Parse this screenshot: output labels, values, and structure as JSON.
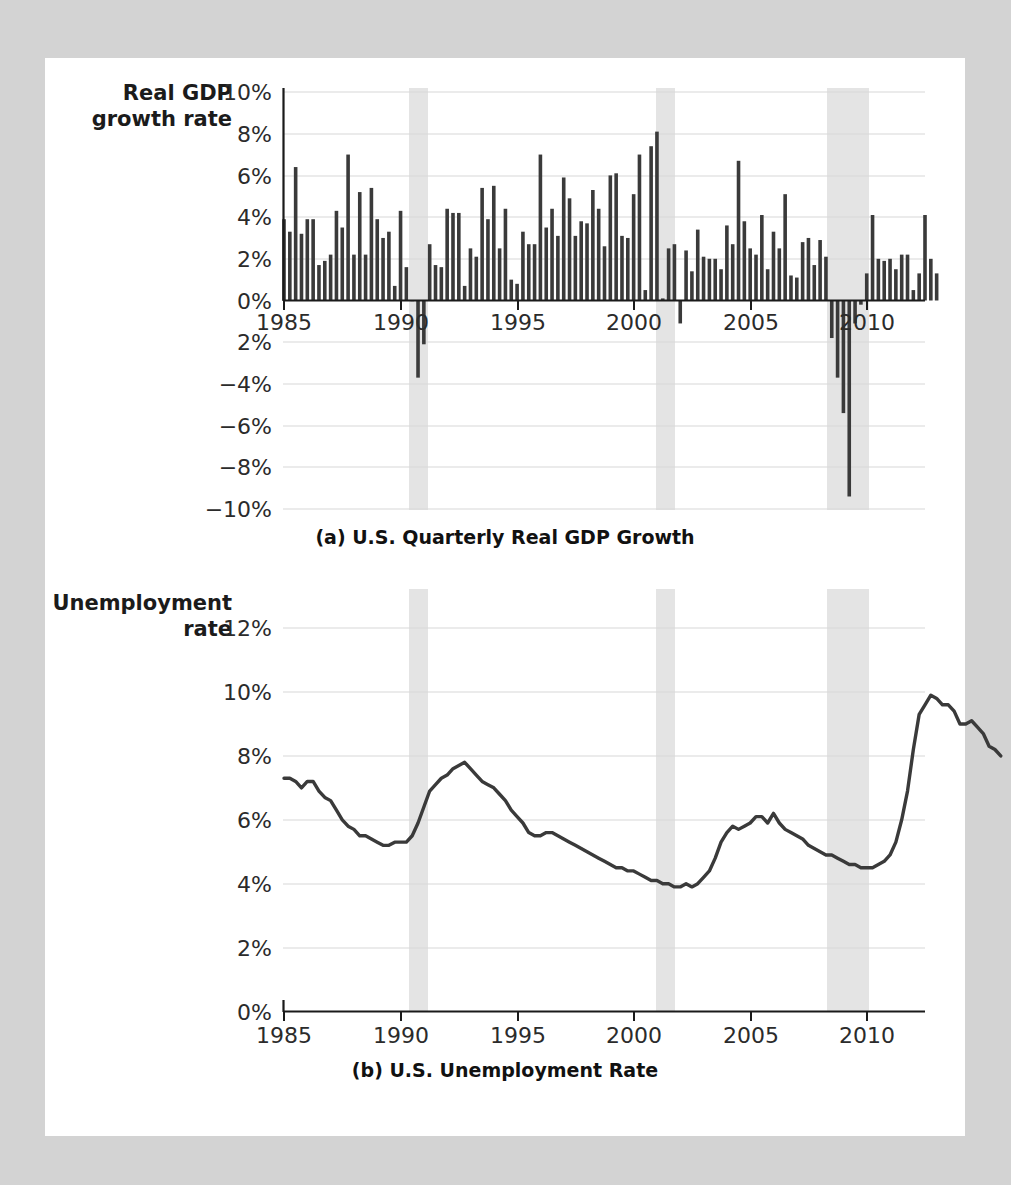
{
  "page": {
    "background_color": "#d3d3d3",
    "sheet_color": "#ffffff"
  },
  "panel_a": {
    "y_axis_title_line1": "Real GDP",
    "y_axis_title_line2": "growth rate",
    "caption": "(a) U.S. Quarterly Real GDP Growth",
    "y_ticks": [
      "10%",
      "8%",
      "6%",
      "4%",
      "2%",
      "0%",
      "2%",
      "−4%",
      "−6%",
      "−8%",
      "−10%"
    ],
    "x_ticks": [
      "1985",
      "1990",
      "1995",
      "2000",
      "2005",
      "2010"
    ]
  },
  "panel_b": {
    "y_axis_title_line1": "Unemployment",
    "y_axis_title_line2": "rate",
    "caption": "(b) U.S. Unemployment Rate",
    "y_ticks": [
      "12%",
      "10%",
      "8%",
      "6%",
      "4%",
      "2%",
      "0%"
    ],
    "x_ticks": [
      "1985",
      "1990",
      "1995",
      "2000",
      "2005",
      "2010"
    ]
  },
  "chart_data": [
    {
      "type": "bar",
      "title": "(a) U.S. Quarterly Real GDP Growth",
      "xlabel": "",
      "ylabel": "Real GDP growth rate",
      "ylim": [
        -10,
        10
      ],
      "xlim": [
        1985,
        2012.5
      ],
      "grid": true,
      "legend": "none",
      "bar_color": "#3a3a3a",
      "recession_color": "#e4e4e4",
      "recession_bands": [
        [
          1990.5,
          1991.2
        ],
        [
          2001.2,
          2001.9
        ],
        [
          2007.9,
          2009.4
        ]
      ],
      "x_start_year": 1985,
      "x_step_years": 0.25,
      "values": [
        3.9,
        3.3,
        6.4,
        3.2,
        3.9,
        3.9,
        1.7,
        1.9,
        2.2,
        4.3,
        3.5,
        7.0,
        2.2,
        5.2,
        2.2,
        5.4,
        3.9,
        3.0,
        3.3,
        0.7,
        4.3,
        1.6,
        0.0,
        -3.7,
        -2.1,
        2.7,
        1.7,
        1.6,
        4.4,
        4.2,
        4.2,
        0.7,
        2.5,
        2.1,
        5.4,
        3.9,
        5.5,
        2.5,
        4.4,
        1.0,
        0.8,
        3.3,
        2.7,
        2.7,
        7.0,
        3.5,
        4.4,
        3.1,
        5.9,
        4.9,
        3.1,
        3.8,
        3.7,
        5.3,
        4.4,
        2.6,
        6.0,
        6.1,
        3.1,
        3.0,
        5.1,
        7.0,
        0.5,
        7.4,
        8.1,
        0.1,
        2.5,
        2.7,
        -1.1,
        2.4,
        1.4,
        3.4,
        2.1,
        2.0,
        2.0,
        1.5,
        3.6,
        2.7,
        6.7,
        3.8,
        2.5,
        2.2,
        4.1,
        1.5,
        3.3,
        2.5,
        5.1,
        1.2,
        1.1,
        2.8,
        3.0,
        1.7,
        2.9,
        2.1,
        -1.8,
        -3.7,
        -5.4,
        -9.4,
        -1.1,
        -0.2,
        1.3,
        4.1,
        2.0,
        1.9,
        2.0,
        1.5,
        2.2,
        2.2,
        0.5,
        1.3,
        4.1,
        2.0,
        1.3
      ]
    },
    {
      "type": "line",
      "title": "(b) U.S. Unemployment Rate",
      "xlabel": "",
      "ylabel": "Unemployment rate",
      "ylim": [
        0,
        12
      ],
      "xlim": [
        1985,
        2012.5
      ],
      "grid": true,
      "legend": "none",
      "line_color": "#3a3a3a",
      "recession_color": "#e4e4e4",
      "recession_bands": [
        [
          1990.5,
          1991.2
        ],
        [
          2001.2,
          2001.9
        ],
        [
          2007.9,
          2009.4
        ]
      ],
      "x_start_year": 1985,
      "x_step_years": 0.25,
      "values": [
        7.3,
        7.3,
        7.2,
        7.0,
        7.2,
        7.2,
        6.9,
        6.7,
        6.6,
        6.3,
        6.0,
        5.8,
        5.7,
        5.5,
        5.5,
        5.4,
        5.3,
        5.2,
        5.2,
        5.3,
        5.3,
        5.3,
        5.5,
        5.9,
        6.4,
        6.9,
        7.1,
        7.3,
        7.4,
        7.6,
        7.7,
        7.8,
        7.6,
        7.4,
        7.2,
        7.1,
        7.0,
        6.8,
        6.6,
        6.3,
        6.1,
        5.9,
        5.6,
        5.5,
        5.5,
        5.6,
        5.6,
        5.5,
        5.4,
        5.3,
        5.2,
        5.1,
        5.0,
        4.9,
        4.8,
        4.7,
        4.6,
        4.5,
        4.5,
        4.4,
        4.4,
        4.3,
        4.2,
        4.1,
        4.1,
        4.0,
        4.0,
        3.9,
        3.9,
        4.0,
        3.9,
        4.0,
        4.2,
        4.4,
        4.8,
        5.3,
        5.6,
        5.8,
        5.7,
        5.8,
        5.9,
        6.1,
        6.1,
        5.9,
        6.2,
        5.9,
        5.7,
        5.6,
        5.5,
        5.4,
        5.2,
        5.1,
        5.0,
        4.9,
        4.9,
        4.8,
        4.7,
        4.6,
        4.6,
        4.5,
        4.5,
        4.5,
        4.6,
        4.7,
        4.9,
        5.3,
        6.0,
        6.9,
        8.2,
        9.3,
        9.6,
        9.9,
        9.8,
        9.6,
        9.6,
        9.4,
        9.0,
        9.0,
        9.1,
        8.9,
        8.7,
        8.3,
        8.2,
        8.0
      ]
    }
  ]
}
